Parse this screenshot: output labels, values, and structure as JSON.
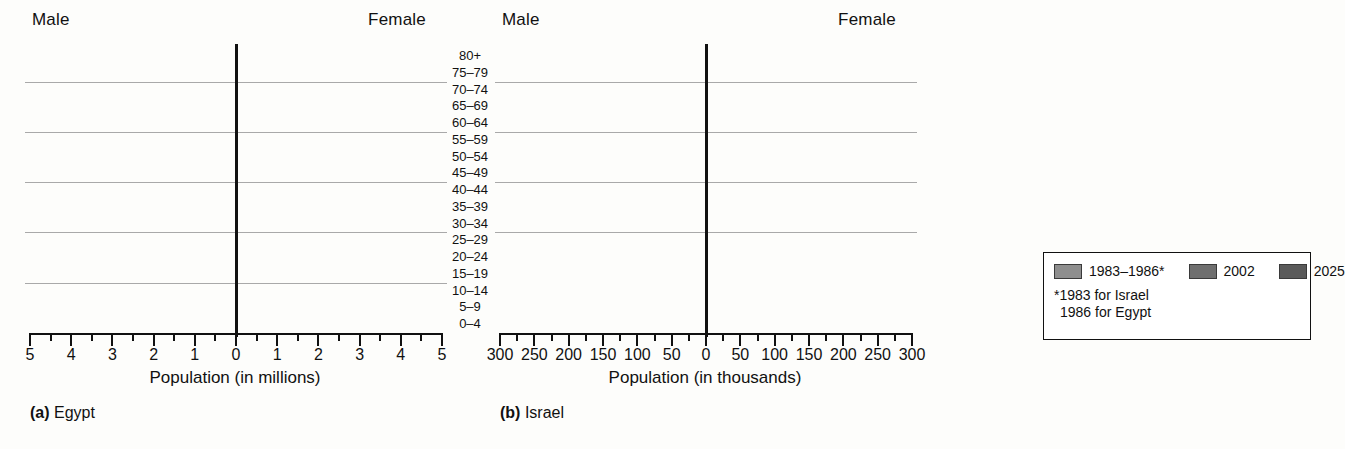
{
  "figure": {
    "male_label": "Male",
    "female_label": "Female",
    "age_groups": [
      "80+",
      "75–79",
      "70–74",
      "65–69",
      "60–64",
      "55–59",
      "50–54",
      "45–49",
      "40–44",
      "35–39",
      "30–34",
      "25–29",
      "20–24",
      "15–19",
      "10–14",
      "5–9",
      "0–4"
    ]
  },
  "legend": {
    "items": [
      {
        "label": "1983–1986*",
        "color": "#8e8e8e"
      },
      {
        "label": "2002",
        "color": "#6f6f6f"
      },
      {
        "label": "2025",
        "color": "#5a5a5a"
      }
    ],
    "note_line1": "*1983 for Israel",
    "note_line2": "1986 for Egypt"
  },
  "chart_data": [
    {
      "type": "bar",
      "orientation": "population-pyramid",
      "title": "(a) Egypt",
      "caption_letter": "(a)",
      "caption_name": "Egypt",
      "xlabel": "Population (in millions)",
      "ylabel": "",
      "unit": "millions",
      "xlim": [
        -5,
        5
      ],
      "xticks": [
        5,
        4,
        3,
        2,
        1,
        0,
        1,
        2,
        3,
        4,
        5
      ],
      "xtick_labels": [
        "5",
        "4",
        "3",
        "2",
        "1",
        "0",
        "1",
        "2",
        "3",
        "4",
        "5"
      ],
      "minor_tick_step": 0.5,
      "grid": "horizontal-bands",
      "gridline_after_groups": [
        "75–79",
        "60–64",
        "45–49",
        "30–34",
        "15–19"
      ],
      "categories": [
        "80+",
        "75–79",
        "70–74",
        "65–69",
        "60–64",
        "55–59",
        "50–54",
        "45–49",
        "40–44",
        "35–39",
        "30–34",
        "25–29",
        "20–24",
        "15–19",
        "10–14",
        "5–9",
        "0–4"
      ],
      "series": [
        {
          "name": "1983–1986*",
          "side": "male",
          "values": [
            0.12,
            0.2,
            0.3,
            0.42,
            0.56,
            0.72,
            0.9,
            1.1,
            1.32,
            1.58,
            1.85,
            2.15,
            2.55,
            3.2,
            3.95,
            4.05,
            4.15
          ]
        },
        {
          "name": "2002",
          "side": "male",
          "values": [
            0.22,
            0.36,
            0.52,
            0.72,
            0.96,
            1.24,
            1.55,
            1.9,
            2.28,
            2.7,
            3.1,
            3.45,
            3.7,
            3.85,
            4.0,
            4.1,
            4.2
          ]
        },
        {
          "name": "2025",
          "side": "male",
          "values": [
            0.32,
            0.52,
            0.78,
            1.05,
            1.4,
            1.78,
            2.18,
            2.62,
            3.05,
            3.4,
            3.68,
            3.85,
            3.95,
            4.05,
            4.15,
            4.2,
            4.25
          ]
        },
        {
          "name": "1983–1986*",
          "side": "female",
          "values": [
            0.14,
            0.22,
            0.33,
            0.45,
            0.6,
            0.78,
            0.96,
            1.16,
            1.4,
            1.66,
            1.94,
            2.26,
            2.66,
            3.3,
            3.95,
            4.05,
            4.15
          ]
        },
        {
          "name": "2002",
          "side": "female",
          "values": [
            0.25,
            0.4,
            0.57,
            0.78,
            1.02,
            1.32,
            1.64,
            2.0,
            2.38,
            2.8,
            3.18,
            3.52,
            3.76,
            3.9,
            4.02,
            4.12,
            4.2
          ]
        },
        {
          "name": "2025",
          "side": "female",
          "values": [
            0.36,
            0.58,
            0.84,
            1.12,
            1.48,
            1.86,
            2.26,
            2.7,
            3.12,
            3.46,
            3.72,
            3.9,
            4.0,
            4.08,
            4.16,
            4.22,
            4.26
          ]
        }
      ]
    },
    {
      "type": "bar",
      "orientation": "population-pyramid",
      "title": "(b) Israel",
      "caption_letter": "(b)",
      "caption_name": "Israel",
      "xlabel": "Population (in thousands)",
      "ylabel": "",
      "unit": "thousands",
      "xlim": [
        -300,
        300
      ],
      "xticks": [
        300,
        250,
        200,
        150,
        100,
        50,
        0,
        50,
        100,
        150,
        200,
        250,
        300
      ],
      "xtick_labels": [
        "300",
        "250",
        "200",
        "150",
        "100",
        "50",
        "0",
        "50",
        "100",
        "150",
        "200",
        "250",
        "300"
      ],
      "minor_tick_step": 25,
      "grid": "horizontal-bands",
      "gridline_after_groups": [
        "75–79",
        "60–64",
        "45–49",
        "30–34",
        "15–79"
      ],
      "categories": [
        "80+",
        "75–79",
        "70–74",
        "65–69",
        "60–64",
        "55–59",
        "50–54",
        "45–49",
        "40–44",
        "35–39",
        "30–34",
        "25–29",
        "20–24",
        "15–19",
        "10–14",
        "5–9",
        "0–4"
      ],
      "series": [
        {
          "name": "1983–1986*",
          "side": "male",
          "values": [
            32,
            44,
            62,
            72,
            84,
            96,
            104,
            120,
            132,
            146,
            158,
            172,
            186,
            200,
            214,
            222,
            228
          ]
        },
        {
          "name": "2002",
          "side": "male",
          "values": [
            62,
            72,
            90,
            104,
            124,
            140,
            152,
            168,
            184,
            198,
            212,
            226,
            240,
            254,
            262,
            266,
            268
          ]
        },
        {
          "name": "2025",
          "side": "male",
          "values": [
            104,
            92,
            118,
            136,
            156,
            176,
            192,
            210,
            224,
            238,
            250,
            262,
            272,
            282,
            288,
            290,
            292
          ]
        },
        {
          "name": "1983–1986*",
          "side": "female",
          "values": [
            42,
            54,
            70,
            80,
            92,
            104,
            114,
            128,
            142,
            156,
            168,
            182,
            196,
            208,
            220,
            226,
            232
          ]
        },
        {
          "name": "2002",
          "side": "female",
          "values": [
            88,
            86,
            104,
            120,
            138,
            152,
            166,
            182,
            196,
            210,
            224,
            238,
            250,
            262,
            270,
            274,
            276
          ]
        },
        {
          "name": "2025",
          "side": "female",
          "values": [
            152,
            112,
            134,
            152,
            172,
            190,
            206,
            222,
            236,
            248,
            260,
            270,
            278,
            286,
            292,
            294,
            296
          ]
        }
      ]
    }
  ]
}
